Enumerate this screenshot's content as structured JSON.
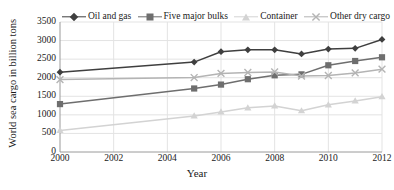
{
  "chart_data": {
    "type": "line",
    "title": "",
    "xlabel": "Year",
    "ylabel": "World sea cargo in billion tons",
    "x": [
      2000,
      2005,
      2006,
      2007,
      2008,
      2009,
      2010,
      2011,
      2012
    ],
    "xlim": [
      2000,
      2012
    ],
    "ylim": [
      0,
      3500
    ],
    "xticks": [
      2000,
      2002,
      2004,
      2006,
      2008,
      2010,
      2012
    ],
    "xtick_labels": [
      "2000",
      "2002",
      "2004",
      "2006",
      "2008",
      "2010",
      "2012"
    ],
    "yticks": [
      0,
      500,
      1000,
      1500,
      2000,
      2500,
      3000,
      3500
    ],
    "ytick_labels": [
      "0",
      "500",
      "1000",
      "1500",
      "2000",
      "2500",
      "3000",
      "3500"
    ],
    "grid": "horizontal-and-vertical",
    "legend_position": "top",
    "series": [
      {
        "name": "Oil and gas",
        "color": "#3f3f3f",
        "marker": "diamond",
        "values": [
          2150,
          2420,
          2700,
          2750,
          2750,
          2640,
          2770,
          2790,
          3030
        ]
      },
      {
        "name": "Five major bulks",
        "color": "#6e6e6e",
        "marker": "square",
        "values": [
          1290,
          1710,
          1815,
          1960,
          2065,
          2090,
          2335,
          2450,
          2550
        ]
      },
      {
        "name": "Container",
        "color": "#d3d3d3",
        "marker": "triangle",
        "values": [
          580,
          970,
          1080,
          1190,
          1240,
          1110,
          1270,
          1375,
          1490
        ]
      },
      {
        "name": "Other dry cargo",
        "color": "#b4b4b4",
        "marker": "x",
        "values": [
          1950,
          2005,
          2115,
          2140,
          2155,
          2045,
          2060,
          2130,
          2230
        ]
      }
    ]
  },
  "legend": {
    "items": [
      {
        "label": "Oil and gas"
      },
      {
        "label": "Five major bulks"
      },
      {
        "label": "Container"
      },
      {
        "label": "Other dry cargo"
      }
    ]
  },
  "axes": {
    "x_title": "Year",
    "y_title": "World sea cargo in billion tons"
  },
  "colors": {
    "grid": "#e3e3e3",
    "axis": "#9a9a9a",
    "text": "#1a1a1a",
    "background": "#ffffff"
  }
}
